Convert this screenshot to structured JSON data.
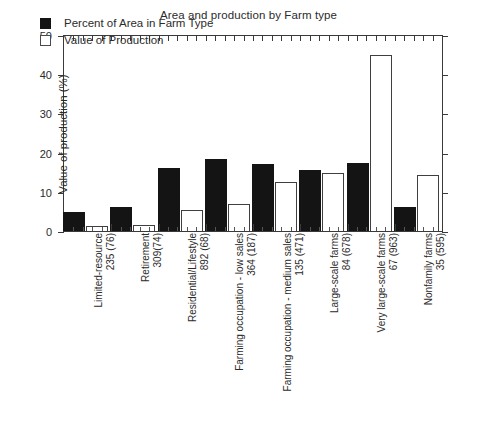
{
  "chart_data": {
    "type": "bar",
    "title": "Area and production by Farm type",
    "xlabel": "",
    "ylabel": "Value of production (%)",
    "y2label": "Total farm area/production (%)",
    "ylim": [
      0,
      50
    ],
    "yticks": [
      0,
      10,
      20,
      30,
      40,
      50
    ],
    "grid": false,
    "legend_position": "upper-left-inside",
    "categories": [
      "Limited-resource 235 (76)",
      "Retirement 309(74)",
      "Residential/Lifestyle 892 (68)",
      "Farming occupation - low sales 364 (187)",
      "Farming occupation - medium sales 135 (471)",
      "Large-scale farms 84 (678)",
      "Very large-scale farms 67 (963)",
      "Nonfamily farms 35 (595)"
    ],
    "category_lines": [
      {
        "line1": "Limited-resource",
        "line2": "235 (76)"
      },
      {
        "line1": "Retirement",
        "line2": "309(74)"
      },
      {
        "line1": "Residential/Lifestyle",
        "line2": "892 (68)"
      },
      {
        "line1": "Farming occupation - low sales",
        "line2": "364 (187)"
      },
      {
        "line1": "Farming occupation - medium sales",
        "line2": "135 (471)"
      },
      {
        "line1": "Large-scale farms",
        "line2": "84 (678)"
      },
      {
        "line1": "Very large-scale farms",
        "line2": "67 (963)"
      },
      {
        "line1": "Nonfamily farms",
        "line2": "35 (595)"
      }
    ],
    "series": [
      {
        "name": "Percent of Area in Farm Type",
        "color": "#141414",
        "values": [
          4.8,
          6.1,
          16.2,
          18.4,
          17.2,
          15.6,
          17.5,
          6.2
        ]
      },
      {
        "name": "Value of Production",
        "color": "#ffffff",
        "values": [
          1.3,
          1.6,
          5.4,
          6.8,
          12.5,
          14.8,
          45.2,
          14.3
        ]
      }
    ]
  },
  "ytick_labels": [
    "50",
    "40",
    "30",
    "20",
    "10",
    "0"
  ],
  "legend": {
    "entries": [
      {
        "label": "Percent of Area in Farm Type",
        "swatch": "filled-square-icon"
      },
      {
        "label": "Value of Production",
        "swatch": "open-square-icon"
      }
    ]
  }
}
